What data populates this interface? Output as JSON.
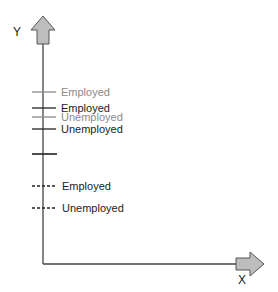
{
  "diagram": {
    "y_axis_label": "Y",
    "x_axis_label": "X",
    "colors": {
      "axis": "#444444",
      "arrow_fill": "#bdbdbd",
      "arrow_stroke": "#555555",
      "dark": "#222222",
      "light": "#8a8a8a"
    },
    "markers": [
      {
        "style": "solid",
        "tone": "light",
        "label": "Employed"
      },
      {
        "style": "solid",
        "tone": "dark",
        "label": "Employed"
      },
      {
        "style": "solid",
        "tone": "light",
        "label": "Unemployed"
      },
      {
        "style": "solid",
        "tone": "dark",
        "label": "Unemployed"
      },
      {
        "style": "solid",
        "tone": "dark",
        "label": ""
      },
      {
        "style": "dashed",
        "tone": "dark",
        "label": "Employed"
      },
      {
        "style": "dashed",
        "tone": "dark",
        "label": "Unemployed"
      }
    ]
  }
}
